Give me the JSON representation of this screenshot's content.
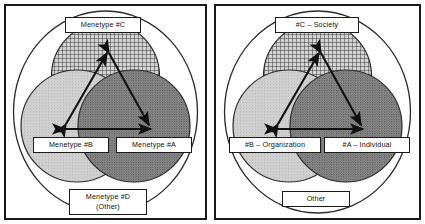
{
  "figure": {
    "type": "venn-diagram-pair"
  },
  "panels": [
    {
      "id": "left",
      "name": "generic-menetype-panel",
      "outer_region_label": "Menetype #D\n(Other)",
      "circles": [
        {
          "key": "C",
          "position": "top",
          "fill_pattern": "cross-hatch-grid",
          "label": "Menetype #C"
        },
        {
          "key": "B",
          "position": "bottom-left",
          "fill_pattern": "light-stipple",
          "label": "Menetype #B"
        },
        {
          "key": "A",
          "position": "bottom-right",
          "fill_pattern": "dark-stipple",
          "label": "Menetype #A"
        }
      ],
      "labels": {
        "top": "Menetype #C",
        "bottom_left": "Menetype #B",
        "bottom_right": "Menetype #A",
        "outer_line1": "Menetype #D",
        "outer_line2": "(Other)"
      },
      "arrows": [
        {
          "from": "B",
          "to": "C",
          "style": "double-headed"
        },
        {
          "from": "C",
          "to": "A",
          "style": "double-headed"
        },
        {
          "from": "B",
          "to": "A",
          "style": "double-headed"
        }
      ]
    },
    {
      "id": "right",
      "name": "named-menetype-panel",
      "outer_region_label": "Other",
      "circles": [
        {
          "key": "C",
          "position": "top",
          "fill_pattern": "cross-hatch-grid",
          "label": "#C – Society"
        },
        {
          "key": "B",
          "position": "bottom-left",
          "fill_pattern": "light-stipple",
          "label": "#B – Organization"
        },
        {
          "key": "A",
          "position": "bottom-right",
          "fill_pattern": "dark-stipple",
          "label": "#A – Individual"
        }
      ],
      "labels": {
        "top": "#C – Society",
        "bottom_left": "#B – Organization",
        "bottom_right": "#A – Individual",
        "outer_line1": "Other"
      },
      "arrows": [
        {
          "from": "B",
          "to": "C",
          "style": "double-headed"
        },
        {
          "from": "C",
          "to": "A",
          "style": "double-headed"
        },
        {
          "from": "B",
          "to": "A",
          "style": "double-headed"
        }
      ]
    }
  ],
  "colors": {
    "stroke": "#1a1a1a",
    "page_background": "#ffffff",
    "circle_top_fill": "#c9c9c9",
    "circle_left_fill": "#cccccc",
    "circle_right_fill": "#8a8a8a",
    "label_background": "#ffffff",
    "label_text": "#111111"
  }
}
